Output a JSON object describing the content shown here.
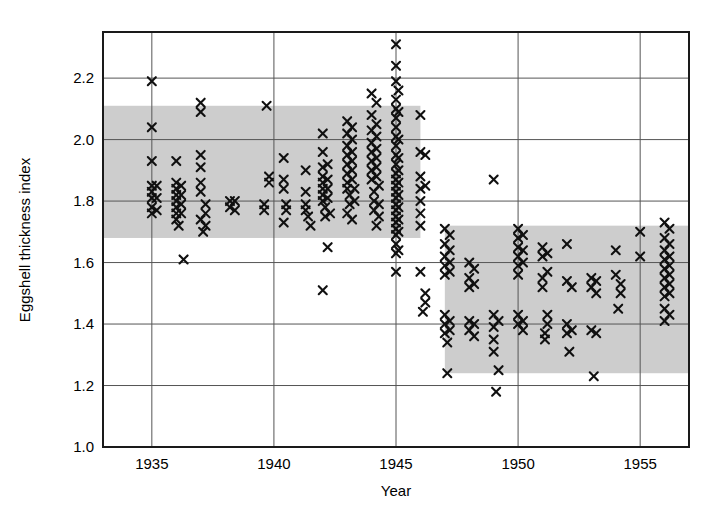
{
  "chart_data": {
    "type": "scatter",
    "title": "",
    "xlabel": "Year",
    "ylabel": "Eggshell thickness index",
    "xlim": [
      1933.0,
      1957.0
    ],
    "ylim": [
      1.0,
      2.35
    ],
    "xticks": [
      1935,
      1940,
      1945,
      1950,
      1955
    ],
    "xtick_labels": [
      "1935",
      "1940",
      "1945",
      "1950",
      "1955"
    ],
    "yticks": [
      1.0,
      1.2,
      1.4,
      1.6,
      1.8,
      2.0,
      2.2
    ],
    "ytick_labels": [
      "1.0",
      "1.2",
      "1.4",
      "1.6",
      "1.8",
      "2.0",
      "2.2"
    ],
    "grid": true,
    "grid_color": "#555555",
    "legend": "none",
    "marker": "x",
    "marker_color": "#101010",
    "band_color": "#cdcdcd",
    "frame_color": "#1a1a1a",
    "bands": [
      {
        "name": "pre-DDT normal range",
        "x_start": 1933.0,
        "x_end": 1946.0,
        "y_low": 1.68,
        "y_high": 2.11
      },
      {
        "name": "post-DDT normal range",
        "x_start": 1947.0,
        "x_end": 1957.0,
        "y_low": 1.24,
        "y_high": 1.72
      }
    ],
    "series": [
      {
        "name": "Eggshell thickness index",
        "points": [
          [
            1935.0,
            2.19
          ],
          [
            1935.0,
            2.04
          ],
          [
            1935.0,
            1.93
          ],
          [
            1935.0,
            1.85
          ],
          [
            1935.0,
            1.83
          ],
          [
            1935.0,
            1.81
          ],
          [
            1935.0,
            1.78
          ],
          [
            1935.0,
            1.76
          ],
          [
            1935.2,
            1.85
          ],
          [
            1935.2,
            1.81
          ],
          [
            1935.2,
            1.77
          ],
          [
            1936.0,
            1.93
          ],
          [
            1936.0,
            1.86
          ],
          [
            1936.0,
            1.84
          ],
          [
            1936.0,
            1.82
          ],
          [
            1936.0,
            1.8
          ],
          [
            1936.0,
            1.78
          ],
          [
            1936.0,
            1.76
          ],
          [
            1936.0,
            1.74
          ],
          [
            1936.2,
            1.85
          ],
          [
            1936.2,
            1.82
          ],
          [
            1936.2,
            1.79
          ],
          [
            1936.2,
            1.76
          ],
          [
            1936.1,
            1.72
          ],
          [
            1936.3,
            1.61
          ],
          [
            1937.0,
            2.12
          ],
          [
            1937.0,
            2.09
          ],
          [
            1937.0,
            1.95
          ],
          [
            1937.0,
            1.91
          ],
          [
            1937.0,
            1.86
          ],
          [
            1937.0,
            1.83
          ],
          [
            1937.2,
            1.79
          ],
          [
            1937.2,
            1.76
          ],
          [
            1937.0,
            1.74
          ],
          [
            1937.2,
            1.72
          ],
          [
            1937.1,
            1.7
          ],
          [
            1938.2,
            1.8
          ],
          [
            1938.2,
            1.78
          ],
          [
            1938.4,
            1.8
          ],
          [
            1938.4,
            1.77
          ],
          [
            1939.7,
            2.11
          ],
          [
            1939.8,
            1.88
          ],
          [
            1939.8,
            1.86
          ],
          [
            1939.6,
            1.79
          ],
          [
            1939.6,
            1.77
          ],
          [
            1940.4,
            1.94
          ],
          [
            1940.4,
            1.87
          ],
          [
            1940.4,
            1.84
          ],
          [
            1940.5,
            1.79
          ],
          [
            1940.5,
            1.77
          ],
          [
            1940.4,
            1.73
          ],
          [
            1941.3,
            1.9
          ],
          [
            1941.3,
            1.83
          ],
          [
            1941.3,
            1.79
          ],
          [
            1941.3,
            1.77
          ],
          [
            1941.4,
            1.75
          ],
          [
            1941.5,
            1.72
          ],
          [
            1942.0,
            2.02
          ],
          [
            1942.0,
            1.96
          ],
          [
            1942.0,
            1.91
          ],
          [
            1942.0,
            1.88
          ],
          [
            1942.0,
            1.86
          ],
          [
            1942.0,
            1.84
          ],
          [
            1942.0,
            1.82
          ],
          [
            1942.0,
            1.8
          ],
          [
            1942.2,
            1.92
          ],
          [
            1942.2,
            1.87
          ],
          [
            1942.2,
            1.84
          ],
          [
            1942.2,
            1.81
          ],
          [
            1942.1,
            1.78
          ],
          [
            1942.1,
            1.75
          ],
          [
            1942.3,
            1.76
          ],
          [
            1942.2,
            1.65
          ],
          [
            1942.0,
            1.51
          ],
          [
            1943.0,
            2.06
          ],
          [
            1943.0,
            2.02
          ],
          [
            1943.0,
            1.98
          ],
          [
            1943.0,
            1.95
          ],
          [
            1943.0,
            1.92
          ],
          [
            1943.0,
            1.89
          ],
          [
            1943.0,
            1.86
          ],
          [
            1943.0,
            1.84
          ],
          [
            1943.2,
            2.04
          ],
          [
            1943.2,
            2.0
          ],
          [
            1943.2,
            1.96
          ],
          [
            1943.2,
            1.93
          ],
          [
            1943.2,
            1.9
          ],
          [
            1943.2,
            1.87
          ],
          [
            1943.1,
            1.82
          ],
          [
            1943.1,
            1.79
          ],
          [
            1943.3,
            1.84
          ],
          [
            1943.3,
            1.8
          ],
          [
            1943.0,
            1.76
          ],
          [
            1943.2,
            1.74
          ],
          [
            1944.0,
            2.15
          ],
          [
            1944.0,
            2.08
          ],
          [
            1944.0,
            2.03
          ],
          [
            1944.0,
            1.99
          ],
          [
            1944.0,
            1.96
          ],
          [
            1944.0,
            1.93
          ],
          [
            1944.0,
            1.9
          ],
          [
            1944.0,
            1.87
          ],
          [
            1944.2,
            2.12
          ],
          [
            1944.2,
            2.05
          ],
          [
            1944.2,
            2.01
          ],
          [
            1944.2,
            1.97
          ],
          [
            1944.2,
            1.94
          ],
          [
            1944.2,
            1.91
          ],
          [
            1944.2,
            1.88
          ],
          [
            1944.3,
            1.85
          ],
          [
            1944.1,
            1.83
          ],
          [
            1944.1,
            1.8
          ],
          [
            1944.3,
            1.79
          ],
          [
            1944.1,
            1.77
          ],
          [
            1944.3,
            1.75
          ],
          [
            1944.2,
            1.72
          ],
          [
            1945.0,
            2.31
          ],
          [
            1945.0,
            2.24
          ],
          [
            1945.0,
            2.19
          ],
          [
            1945.0,
            2.13
          ],
          [
            1945.0,
            2.1
          ],
          [
            1945.0,
            2.07
          ],
          [
            1945.0,
            2.04
          ],
          [
            1945.0,
            2.01
          ],
          [
            1945.0,
            1.98
          ],
          [
            1945.0,
            1.95
          ],
          [
            1945.0,
            1.92
          ],
          [
            1945.0,
            1.89
          ],
          [
            1945.0,
            1.87
          ],
          [
            1945.0,
            1.85
          ],
          [
            1945.0,
            1.83
          ],
          [
            1945.0,
            1.81
          ],
          [
            1945.0,
            1.79
          ],
          [
            1945.0,
            1.77
          ],
          [
            1945.0,
            1.75
          ],
          [
            1945.0,
            1.73
          ],
          [
            1945.0,
            1.71
          ],
          [
            1945.0,
            1.69
          ],
          [
            1945.0,
            1.66
          ],
          [
            1945.0,
            1.63
          ],
          [
            1945.0,
            1.57
          ],
          [
            1945.1,
            2.16
          ],
          [
            1945.1,
            2.09
          ],
          [
            1945.1,
            2.0
          ],
          [
            1945.1,
            1.94
          ],
          [
            1945.1,
            1.9
          ],
          [
            1945.1,
            1.86
          ],
          [
            1945.1,
            1.82
          ],
          [
            1945.1,
            1.78
          ],
          [
            1945.1,
            1.74
          ],
          [
            1945.1,
            1.7
          ],
          [
            1945.1,
            1.64
          ],
          [
            1946.0,
            2.08
          ],
          [
            1946.0,
            1.96
          ],
          [
            1946.0,
            1.88
          ],
          [
            1946.0,
            1.84
          ],
          [
            1946.0,
            1.8
          ],
          [
            1946.0,
            1.76
          ],
          [
            1946.0,
            1.72
          ],
          [
            1946.0,
            1.57
          ],
          [
            1946.2,
            1.95
          ],
          [
            1946.2,
            1.85
          ],
          [
            1946.2,
            1.5
          ],
          [
            1946.2,
            1.47
          ],
          [
            1946.1,
            1.44
          ],
          [
            1947.0,
            1.71
          ],
          [
            1947.0,
            1.66
          ],
          [
            1947.0,
            1.62
          ],
          [
            1947.0,
            1.59
          ],
          [
            1947.0,
            1.56
          ],
          [
            1947.0,
            1.43
          ],
          [
            1947.0,
            1.4
          ],
          [
            1947.0,
            1.37
          ],
          [
            1947.2,
            1.69
          ],
          [
            1947.2,
            1.64
          ],
          [
            1947.2,
            1.6
          ],
          [
            1947.2,
            1.57
          ],
          [
            1947.2,
            1.41
          ],
          [
            1947.2,
            1.38
          ],
          [
            1947.1,
            1.34
          ],
          [
            1947.1,
            1.24
          ],
          [
            1948.0,
            1.6
          ],
          [
            1948.0,
            1.55
          ],
          [
            1948.0,
            1.52
          ],
          [
            1948.0,
            1.41
          ],
          [
            1948.0,
            1.38
          ],
          [
            1948.2,
            1.58
          ],
          [
            1948.2,
            1.53
          ],
          [
            1948.2,
            1.4
          ],
          [
            1948.2,
            1.36
          ],
          [
            1949.0,
            1.87
          ],
          [
            1949.0,
            1.43
          ],
          [
            1949.0,
            1.39
          ],
          [
            1949.0,
            1.35
          ],
          [
            1949.0,
            1.31
          ],
          [
            1949.2,
            1.41
          ],
          [
            1949.2,
            1.25
          ],
          [
            1949.1,
            1.18
          ],
          [
            1950.0,
            1.71
          ],
          [
            1950.0,
            1.68
          ],
          [
            1950.0,
            1.65
          ],
          [
            1950.0,
            1.62
          ],
          [
            1950.0,
            1.59
          ],
          [
            1950.0,
            1.56
          ],
          [
            1950.0,
            1.43
          ],
          [
            1950.0,
            1.4
          ],
          [
            1950.2,
            1.69
          ],
          [
            1950.2,
            1.64
          ],
          [
            1950.2,
            1.6
          ],
          [
            1950.2,
            1.41
          ],
          [
            1950.2,
            1.38
          ],
          [
            1951.0,
            1.65
          ],
          [
            1951.0,
            1.62
          ],
          [
            1951.0,
            1.55
          ],
          [
            1951.0,
            1.52
          ],
          [
            1951.2,
            1.63
          ],
          [
            1951.2,
            1.57
          ],
          [
            1951.2,
            1.43
          ],
          [
            1951.2,
            1.4
          ],
          [
            1951.1,
            1.37
          ],
          [
            1951.1,
            1.35
          ],
          [
            1952.0,
            1.66
          ],
          [
            1952.0,
            1.54
          ],
          [
            1952.0,
            1.4
          ],
          [
            1952.0,
            1.37
          ],
          [
            1952.2,
            1.52
          ],
          [
            1952.2,
            1.38
          ],
          [
            1952.1,
            1.31
          ],
          [
            1953.0,
            1.55
          ],
          [
            1953.0,
            1.52
          ],
          [
            1953.2,
            1.54
          ],
          [
            1953.2,
            1.5
          ],
          [
            1953.0,
            1.38
          ],
          [
            1953.2,
            1.37
          ],
          [
            1953.1,
            1.23
          ],
          [
            1954.0,
            1.64
          ],
          [
            1954.0,
            1.56
          ],
          [
            1954.2,
            1.53
          ],
          [
            1954.2,
            1.5
          ],
          [
            1954.1,
            1.45
          ],
          [
            1955.0,
            1.7
          ],
          [
            1955.0,
            1.62
          ],
          [
            1956.0,
            1.73
          ],
          [
            1956.0,
            1.68
          ],
          [
            1956.0,
            1.64
          ],
          [
            1956.0,
            1.61
          ],
          [
            1956.0,
            1.58
          ],
          [
            1956.0,
            1.55
          ],
          [
            1956.0,
            1.52
          ],
          [
            1956.0,
            1.49
          ],
          [
            1956.0,
            1.45
          ],
          [
            1956.0,
            1.41
          ],
          [
            1956.2,
            1.71
          ],
          [
            1956.2,
            1.66
          ],
          [
            1956.2,
            1.62
          ],
          [
            1956.2,
            1.59
          ],
          [
            1956.2,
            1.56
          ],
          [
            1956.2,
            1.53
          ],
          [
            1956.2,
            1.5
          ],
          [
            1956.2,
            1.43
          ]
        ]
      }
    ]
  },
  "axes": {
    "x_title": "Year",
    "y_title": "Eggshell thickness index"
  }
}
